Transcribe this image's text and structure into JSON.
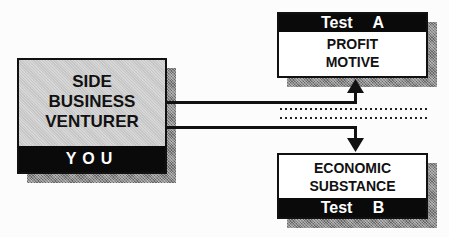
{
  "venturer_box": {
    "title_lines": [
      "SIDE",
      "BUSINESS",
      "VENTURER"
    ],
    "band_label": "YOU"
  },
  "test_a": {
    "header": "Test A",
    "lines": [
      "PROFIT",
      "MOTIVE"
    ]
  },
  "test_b": {
    "lines": [
      "ECONOMIC",
      "SUBSTANCE"
    ],
    "footer": "Test B"
  },
  "colors": {
    "box_fill": "#c6c6c6",
    "band": "#0a0a0a",
    "shadow": "#8a8a8a",
    "line": "#111111"
  }
}
